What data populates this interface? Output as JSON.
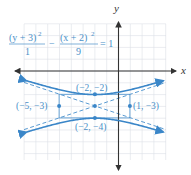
{
  "figure": {
    "x_axis_label": "x",
    "y_axis_label": "y",
    "equation": {
      "term1_numerator": "(y + 3)",
      "term1_exponent": "2",
      "term1_denominator": "1",
      "operator": "−",
      "term2_numerator": "(x + 2)",
      "term2_exponent": "2",
      "term2_denominator": "9",
      "rhs": "= 1"
    },
    "points": [
      {
        "label": "(−2, −2)",
        "x": -2,
        "y": -2
      },
      {
        "label": "(−2, −4)",
        "x": -2,
        "y": -4
      },
      {
        "label": "(−5, −3)",
        "x": -5,
        "y": -3
      },
      {
        "label": "(1, −3)",
        "x": 1,
        "y": -3
      },
      {
        "label": "",
        "x": -2,
        "y": -3
      }
    ],
    "colors": {
      "curve": "#3a86c8",
      "asymptote": "#5a9bd2",
      "grid": "#dcdfe6",
      "axis": "#333333",
      "label": "#4a90c8"
    }
  },
  "chart_data": {
    "type": "line",
    "xlabel": "x",
    "ylabel": "y",
    "grid": true,
    "center": [
      -2,
      -3
    ],
    "a": 1,
    "b": 3,
    "orientation": "vertical transverse axis",
    "vertices": [
      [
        -2,
        -2
      ],
      [
        -2,
        -4
      ]
    ],
    "co_vertices": [
      [
        -5,
        -3
      ],
      [
        1,
        -3
      ]
    ],
    "asymptotes": [
      "y + 3 = (1/3)(x + 2)",
      "y + 3 = −(1/3)(x + 2)"
    ],
    "xlim": [
      -8,
      4
    ],
    "ylim": [
      -8,
      4
    ]
  }
}
